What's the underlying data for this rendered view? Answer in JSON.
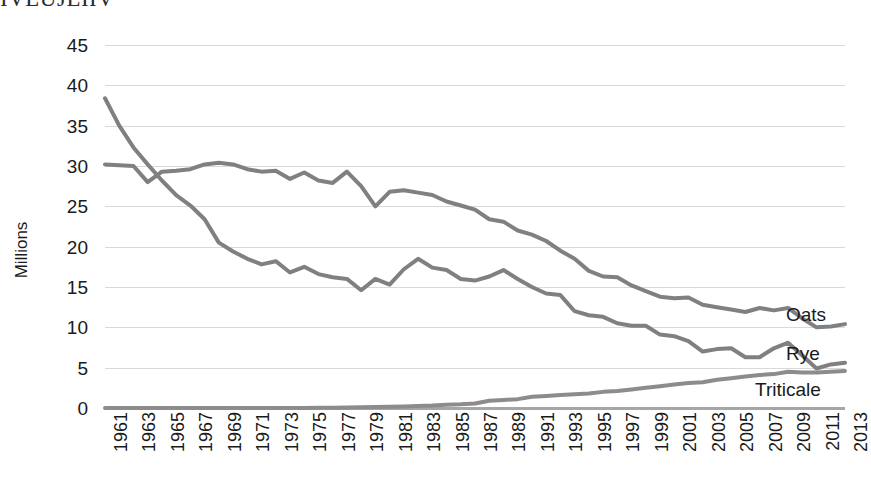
{
  "clipped_header_text": "IVLUJLIIV",
  "chart_data": {
    "type": "line",
    "title": "",
    "subtitle": "",
    "xlabel": "",
    "ylabel": "Millions",
    "ylim": [
      0,
      45
    ],
    "ytick_values": [
      45,
      40,
      35,
      30,
      25,
      20,
      15,
      10,
      5,
      0
    ],
    "ytick_labels": [
      "45",
      "40",
      "35",
      "30",
      "25",
      "20",
      "15",
      "10",
      "5",
      "0"
    ],
    "grid": true,
    "legend_position": "right-inline-labels",
    "x": [
      1961,
      1962,
      1963,
      1964,
      1965,
      1966,
      1967,
      1968,
      1969,
      1970,
      1971,
      1972,
      1973,
      1974,
      1975,
      1976,
      1977,
      1978,
      1979,
      1980,
      1981,
      1982,
      1983,
      1984,
      1985,
      1986,
      1987,
      1988,
      1989,
      1990,
      1991,
      1992,
      1993,
      1994,
      1995,
      1996,
      1997,
      1998,
      1999,
      2000,
      2001,
      2002,
      2003,
      2004,
      2005,
      2006,
      2007,
      2008,
      2009,
      2010,
      2011,
      2012,
      2013
    ],
    "xtick_labels": [
      "1961",
      "1963",
      "1965",
      "1967",
      "1969",
      "1971",
      "1973",
      "1975",
      "1977",
      "1979",
      "1981",
      "1983",
      "1985",
      "1987",
      "1989",
      "1991",
      "1993",
      "1995",
      "1997",
      "1999",
      "2001",
      "2003",
      "2005",
      "2007",
      "2009",
      "2011",
      "2013"
    ],
    "series": [
      {
        "name": "Oats",
        "color": "#808080",
        "label_position": "right",
        "values": [
          30.2,
          30.1,
          30.0,
          28.0,
          29.3,
          29.4,
          29.6,
          30.2,
          30.4,
          30.2,
          29.6,
          29.3,
          29.4,
          28.4,
          29.2,
          28.2,
          27.9,
          29.3,
          27.5,
          25.0,
          26.8,
          27.0,
          26.7,
          26.4,
          25.6,
          25.1,
          24.6,
          23.4,
          23.1,
          22.0,
          21.5,
          20.7,
          19.5,
          18.5,
          17.0,
          16.3,
          16.2,
          15.2,
          14.5,
          13.8,
          13.6,
          13.7,
          12.8,
          12.5,
          12.2,
          11.9,
          12.4,
          12.1,
          12.4,
          11.1,
          10.0,
          10.1,
          10.4
        ]
      },
      {
        "name": "Rye",
        "color": "#808080",
        "label_position": "right",
        "values": [
          38.4,
          35.0,
          32.3,
          30.2,
          28.2,
          26.4,
          25.1,
          23.4,
          20.5,
          19.4,
          18.5,
          17.8,
          18.2,
          16.8,
          17.5,
          16.6,
          16.2,
          16.0,
          14.6,
          16.0,
          15.3,
          17.2,
          18.5,
          17.4,
          17.1,
          16.0,
          15.8,
          16.3,
          17.1,
          16.0,
          15.0,
          14.2,
          14.0,
          12.0,
          11.5,
          11.3,
          10.5,
          10.2,
          10.2,
          9.1,
          8.9,
          8.3,
          7.0,
          7.3,
          7.4,
          6.3,
          6.3,
          7.4,
          8.1,
          6.5,
          4.9,
          5.4,
          5.6
        ]
      },
      {
        "name": "Triticale",
        "color": "#8c8c8c",
        "label_position": "right",
        "values": [
          0.0,
          0.0,
          0.0,
          0.0,
          0.0,
          0.0,
          0.0,
          0.0,
          0.0,
          0.0,
          0.0,
          0.0,
          0.0,
          0.0,
          0.0,
          0.02,
          0.04,
          0.06,
          0.09,
          0.12,
          0.15,
          0.2,
          0.25,
          0.3,
          0.4,
          0.45,
          0.55,
          0.9,
          1.0,
          1.1,
          1.4,
          1.5,
          1.6,
          1.7,
          1.8,
          2.0,
          2.1,
          2.3,
          2.5,
          2.7,
          2.9,
          3.1,
          3.2,
          3.5,
          3.7,
          3.9,
          4.1,
          4.2,
          4.5,
          4.4,
          4.4,
          4.5,
          4.6
        ]
      }
    ]
  },
  "axis_style": {
    "gridline_color": "#d9d9d9",
    "axis_color": "#a6a6a6",
    "text_color": "#1a1a1a",
    "background": "#ffffff"
  }
}
